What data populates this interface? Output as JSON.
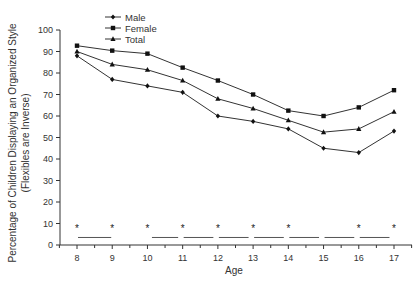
{
  "chart_data": {
    "type": "line",
    "title": "",
    "xlabel": "Age",
    "ylabel": "Percentage of Children Displaying an Organized Style",
    "ylabel_sub": "(Flexibles are Inverse)",
    "x": [
      8,
      9,
      10,
      11,
      12,
      13,
      14,
      15,
      16,
      17
    ],
    "xlim": [
      7.5,
      17.5
    ],
    "ylim": [
      0,
      100
    ],
    "yticks": [
      0,
      10,
      20,
      30,
      40,
      50,
      60,
      70,
      80,
      90,
      100
    ],
    "xticks": [
      8,
      9,
      10,
      11,
      12,
      13,
      14,
      15,
      16,
      17
    ],
    "grid": false,
    "legend_position": "top-left",
    "legend": [
      "Male",
      "Female",
      "Total"
    ],
    "series_label_note": "Markers are too small to distinguish at this resolution; series-to-label mapping is inferred from vertical order (Total between Female and Male), not read from marker shapes.",
    "series": [
      {
        "name": "Male",
        "label_confidence": "inferred",
        "position": "bottom",
        "marker": "diamond",
        "values": [
          88,
          77,
          74,
          71,
          60,
          57.5,
          54,
          45,
          43,
          53
        ]
      },
      {
        "name": "Female",
        "label_confidence": "inferred",
        "position": "top",
        "marker": "square",
        "values": [
          92.7,
          90.4,
          89,
          82.5,
          76.5,
          70,
          62.5,
          60,
          64,
          72
        ]
      },
      {
        "name": "Total",
        "label_confidence": "inferred",
        "position": "middle",
        "marker": "triangle",
        "values": [
          90,
          84,
          81.5,
          76.5,
          68,
          63.5,
          58,
          52.5,
          54,
          62
        ]
      }
    ],
    "significance_stars": {
      "symbol": "*",
      "ages": [
        8,
        9,
        10,
        11,
        12,
        13,
        14,
        16,
        17
      ],
      "y": 8
    },
    "significance_bars": {
      "y": 3.5,
      "segments": [
        [
          8,
          9
        ],
        [
          10.1,
          10.9
        ],
        [
          11,
          11.9
        ],
        [
          12,
          12.9
        ],
        [
          13,
          13.9
        ],
        [
          14,
          14.9
        ],
        [
          15,
          15.9
        ],
        [
          16,
          16.9
        ]
      ]
    }
  }
}
